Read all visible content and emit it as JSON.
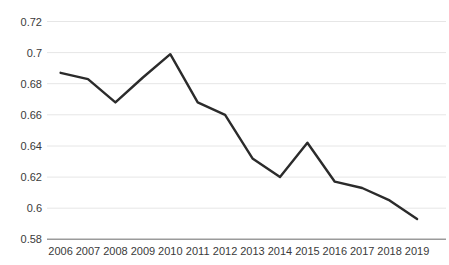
{
  "chart_data": {
    "type": "line",
    "title": "",
    "xlabel": "",
    "ylabel": "",
    "categories": [
      "2006",
      "2007",
      "2008",
      "2009",
      "2010",
      "2011",
      "2012",
      "2013",
      "2014",
      "2015",
      "2016",
      "2017",
      "2018",
      "2019"
    ],
    "series": [
      {
        "name": "series-1",
        "values": [
          0.687,
          0.683,
          0.668,
          0.684,
          0.699,
          0.668,
          0.66,
          0.632,
          0.62,
          0.642,
          0.617,
          0.613,
          0.605,
          0.593
        ]
      }
    ],
    "ylim": [
      0.58,
      0.72
    ],
    "ytick_values": [
      0.58,
      0.6,
      0.62,
      0.64,
      0.66,
      0.68,
      0.7,
      0.72
    ],
    "ytick_labels": [
      "0.58",
      "0.6",
      "0.62",
      "0.64",
      "0.66",
      "0.68",
      "0.7",
      "0.72"
    ],
    "grid": "horizontal-only",
    "legend": "none"
  },
  "colors": {
    "background": "#ffffff",
    "series_line": "#2b2b2b",
    "gridline": "#e6e6e6",
    "axis_line": "#9b9b9b",
    "tick_text": "#3a3a3a"
  }
}
